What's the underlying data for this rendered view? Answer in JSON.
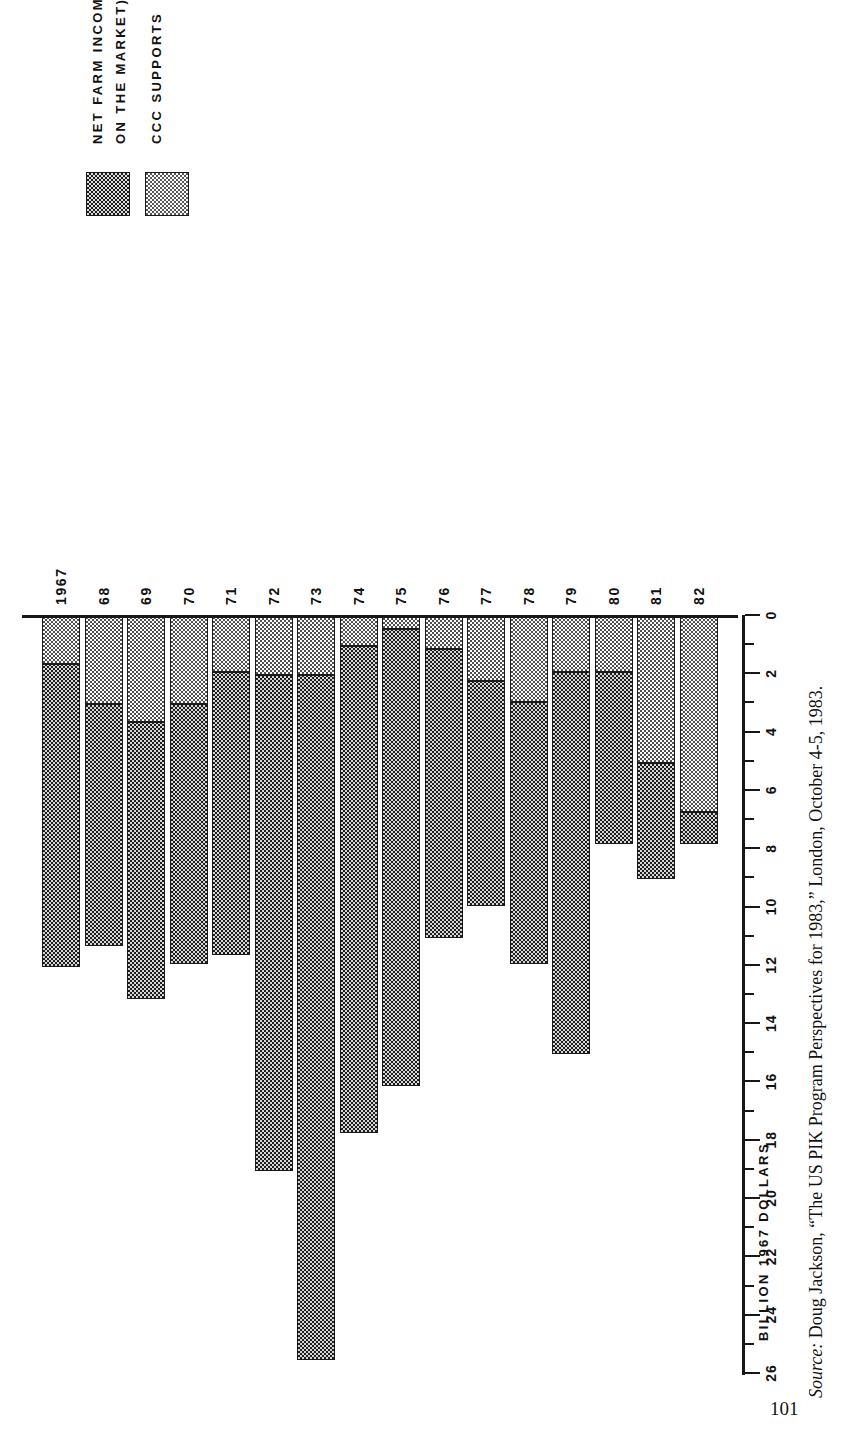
{
  "page": {
    "folio": "101",
    "source_prefix": "Source:",
    "source_text": " Doug Jackson, “The US PIK Program Perspectives for 1983,” London, October 4-5, 1983."
  },
  "legend": {
    "items": [
      {
        "swatch": "dark-dotted-swatch",
        "label_line1": "NET FARM INCOME (FROM SALES",
        "label_line2": "ON THE MARKET)"
      },
      {
        "swatch": "light-dotted-swatch",
        "label_line1": "CCC  SUPPORTS",
        "label_line2": ""
      }
    ]
  },
  "axis": {
    "title": "BILLION  1967  DOLLARS",
    "tick_labels": [
      "26",
      "24",
      "22",
      "20",
      "18",
      "16",
      "14",
      "12",
      "10",
      "8",
      "6",
      "4",
      "2",
      "0"
    ]
  },
  "chart_data": {
    "type": "bar",
    "title": "BILLION 1967 DOLLARS",
    "subtitle": "",
    "orientation": "horizontal-stacked",
    "xlabel": "",
    "ylabel": "BILLION 1967 DOLLARS",
    "ylim": [
      0,
      26
    ],
    "grid": false,
    "legend_position": "top-left",
    "categories": [
      "1967",
      "68",
      "69",
      "70",
      "71",
      "72",
      "73",
      "74",
      "75",
      "76",
      "77",
      "78",
      "79",
      "80",
      "81",
      "82"
    ],
    "series": [
      {
        "name": "NET FARM INCOME (FROM SALES ON THE MARKET)",
        "values": [
          10.4,
          8.3,
          9.5,
          8.9,
          9.7,
          17.0,
          23.5,
          16.7,
          15.7,
          9.9,
          7.7,
          9.0,
          13.1,
          5.9,
          4.0,
          1.1
        ]
      },
      {
        "name": "CCC SUPPORTS",
        "values": [
          1.6,
          3.0,
          3.6,
          3.0,
          1.9,
          2.0,
          2.0,
          1.0,
          0.4,
          1.1,
          2.2,
          2.9,
          1.9,
          1.9,
          5.0,
          6.7
        ]
      }
    ],
    "totals": [
      12.0,
      11.3,
      13.1,
      11.9,
      11.6,
      19.0,
      25.5,
      17.7,
      16.1,
      11.0,
      9.9,
      11.9,
      15.0,
      7.8,
      9.0,
      7.8
    ],
    "annotations": []
  },
  "colors": {
    "dark": "#1d1d1d",
    "light": "#fcfcfc",
    "axis": "#171717"
  }
}
